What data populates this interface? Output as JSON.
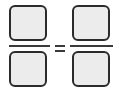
{
  "equation": {
    "description": "Equivalent fractions template with empty input boxes",
    "left_fraction": {
      "numerator": "",
      "denominator": ""
    },
    "operator": "=",
    "right_fraction": {
      "numerator": "",
      "denominator": ""
    }
  },
  "colors": {
    "box_fill": "#ececec",
    "box_border": "#2b2b2b",
    "line": "#3a3a3a",
    "background": "#ffffff"
  }
}
